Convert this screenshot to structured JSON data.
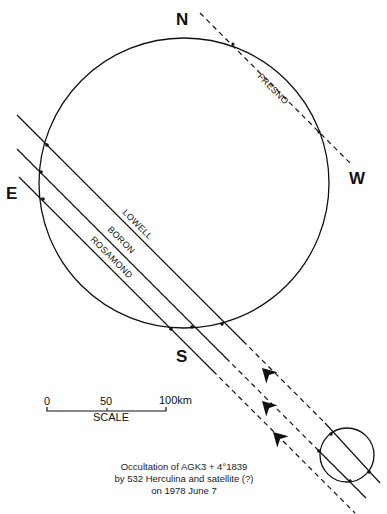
{
  "directions": {
    "north": "N",
    "south": "S",
    "east": "E",
    "west": "W"
  },
  "chords": [
    {
      "name": "LOWELL",
      "style": "solid"
    },
    {
      "name": "BORON",
      "style": "solid"
    },
    {
      "name": "ROSAMOND",
      "style": "solid"
    },
    {
      "name": "FRESNO",
      "style": "dashed"
    }
  ],
  "scale": {
    "ticks": [
      "0",
      "50",
      "100km"
    ],
    "label": "SCALE"
  },
  "caption": {
    "line1": "Occultation of AGK3 + 4°1839",
    "line2": "by 532 Herculina and satellite (?)",
    "line3": "on 1978 June 7"
  },
  "colors": {
    "ink": "#111111",
    "background": "#ffffff"
  }
}
